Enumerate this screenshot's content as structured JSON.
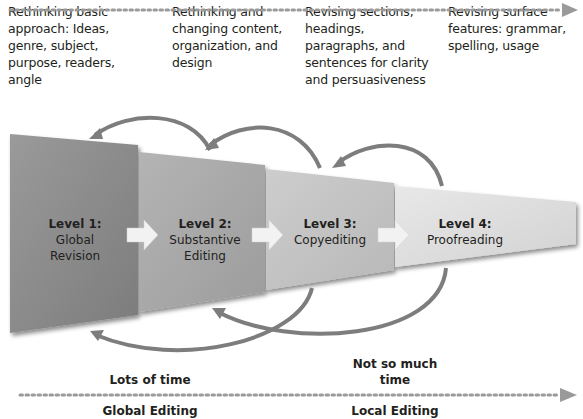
{
  "top_axis": {
    "label": "Issues to focus on"
  },
  "descriptions": [
    "Rethinking basic approach: Ideas, genre, subject, purpose, readers, angle",
    "Rethinking and changing content, organization, and design",
    "Revising sections, headings, paragraphs, and sentences for clarity and persuasiveness",
    "Revising surface features: grammar, spelling, usage"
  ],
  "levels": [
    {
      "title": "Level 1:",
      "line1": "Global",
      "line2": "Revision"
    },
    {
      "title": "Level 2:",
      "line1": "Substantive",
      "line2": "Editing"
    },
    {
      "title": "Level 3:",
      "line1": "Copyediting",
      "line2": ""
    },
    {
      "title": "Level 4:",
      "line1": "Proofreading",
      "line2": ""
    }
  ],
  "time": {
    "left": "Lots of time",
    "right_line1": "Not so much",
    "right_line2": "time"
  },
  "bottom_axis": {
    "left": "Global Editing",
    "right": "Local Editing"
  },
  "colors": {
    "arrow": "#7d7d7d",
    "dots": "#9a9a9a",
    "panel_dark": "#8a8a8a",
    "panel_light": "#e6e6e6"
  }
}
